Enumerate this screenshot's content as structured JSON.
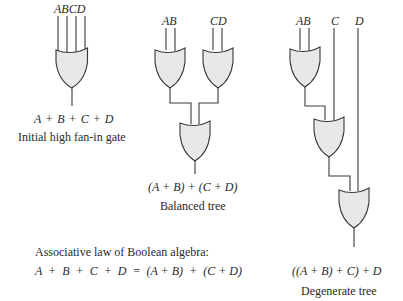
{
  "figure": {
    "panels": [
      {
        "id": "high-fan-in",
        "inputs_label": "ABCD",
        "expression": "A + B + C + D",
        "caption": "Initial high fan-in gate"
      },
      {
        "id": "balanced",
        "inputs_left_label": "AB",
        "inputs_right_label": "CD",
        "expression": "(A + B) + (C + D)",
        "caption": "Balanced tree"
      },
      {
        "id": "degenerate",
        "input_ab_label": "AB",
        "input_c_label": "C",
        "input_d_label": "D",
        "expression": "((A + B) + C) + D",
        "caption": "Degenerate tree"
      }
    ],
    "law": {
      "title": "Associative law of Boolean algebra:",
      "equation": "A  +  B  +  C  +  D  =  (A + B)  +  (C + D)"
    },
    "colors": {
      "gate_fill": "#e8e8e8",
      "line": "#3a3a3a"
    },
    "gate_type": "or-gate"
  }
}
